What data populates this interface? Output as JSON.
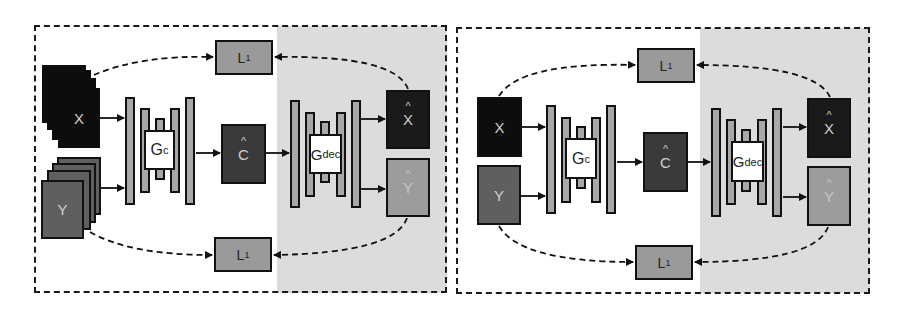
{
  "figure": {
    "panels": [
      {
        "id": "left",
        "variant": "stacked-inputs",
        "loss_top": {
          "label": "L",
          "sub": "1"
        },
        "loss_bottom": {
          "label": "L",
          "sub": "1"
        },
        "input_x": "X",
        "input_y": "Y",
        "encoder": {
          "label": "G",
          "sub": "c"
        },
        "latent": {
          "label": "C",
          "hat": "^"
        },
        "decoder": {
          "label": "G",
          "sub": "dec"
        },
        "output_x": {
          "label": "X",
          "hat": "^"
        },
        "output_y": {
          "label": "Y",
          "hat": "^"
        }
      },
      {
        "id": "right",
        "variant": "single-inputs",
        "loss_top": {
          "label": "L",
          "sub": "1"
        },
        "loss_bottom": {
          "label": "L",
          "sub": "1"
        },
        "input_x": "X",
        "input_y": "Y",
        "encoder": {
          "label": "G",
          "sub": "c"
        },
        "latent": {
          "label": "C",
          "hat": "^"
        },
        "decoder": {
          "label": "G",
          "sub": "dec"
        },
        "output_x": {
          "label": "X",
          "hat": "^"
        },
        "output_y": {
          "label": "Y",
          "hat": "^"
        }
      }
    ],
    "colors": {
      "border": "#111111",
      "shade": "#dcdcdc",
      "input_x": "#0d0d0d",
      "input_y": "#5f5f5f",
      "latent": "#3a3a3a",
      "output_x": "#1a1a1a",
      "output_y": "#9c9c9c",
      "loss": "#9a9a9a",
      "layer": "#a8a8a8"
    }
  }
}
